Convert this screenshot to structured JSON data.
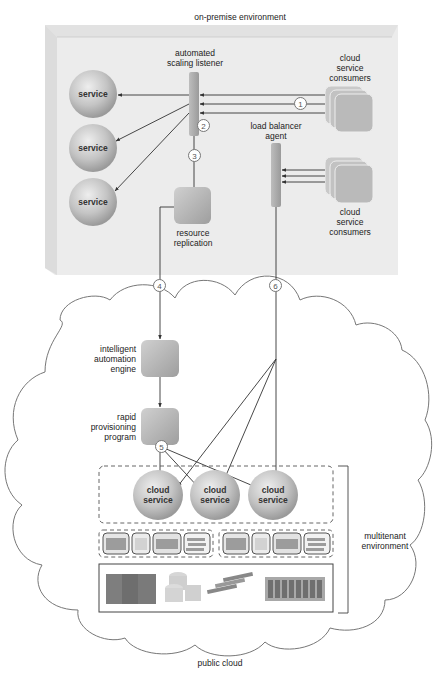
{
  "diagram": {
    "on_premise": {
      "title": "on-premise environment",
      "services": [
        "service",
        "service",
        "service"
      ],
      "automated_scaling_listener": "automated\nscaling listener",
      "load_balancer_agent": "load balancer\nagent",
      "resource_replication": "resource\nreplication",
      "consumers_top": "cloud\nservice\nconsumers",
      "consumers_bottom": "cloud\nservice\nconsumers"
    },
    "public_cloud": {
      "title": "public cloud",
      "intelligent_automation_engine": "intelligent\nautomation\nengine",
      "rapid_provisioning_program": "rapid\nprovisioning\nprogram",
      "cloud_services": [
        "cloud\nservice",
        "cloud\nservice",
        "cloud\nservice"
      ],
      "multitenant_environment": "multitenant\nenvironment"
    },
    "steps": [
      "1",
      "2",
      "3",
      "4",
      "5",
      "6"
    ],
    "colors": {
      "panel": "#ececec",
      "node_gray": "#b9b9b9",
      "line": "#333333",
      "cloud_outline": "#777777"
    }
  }
}
